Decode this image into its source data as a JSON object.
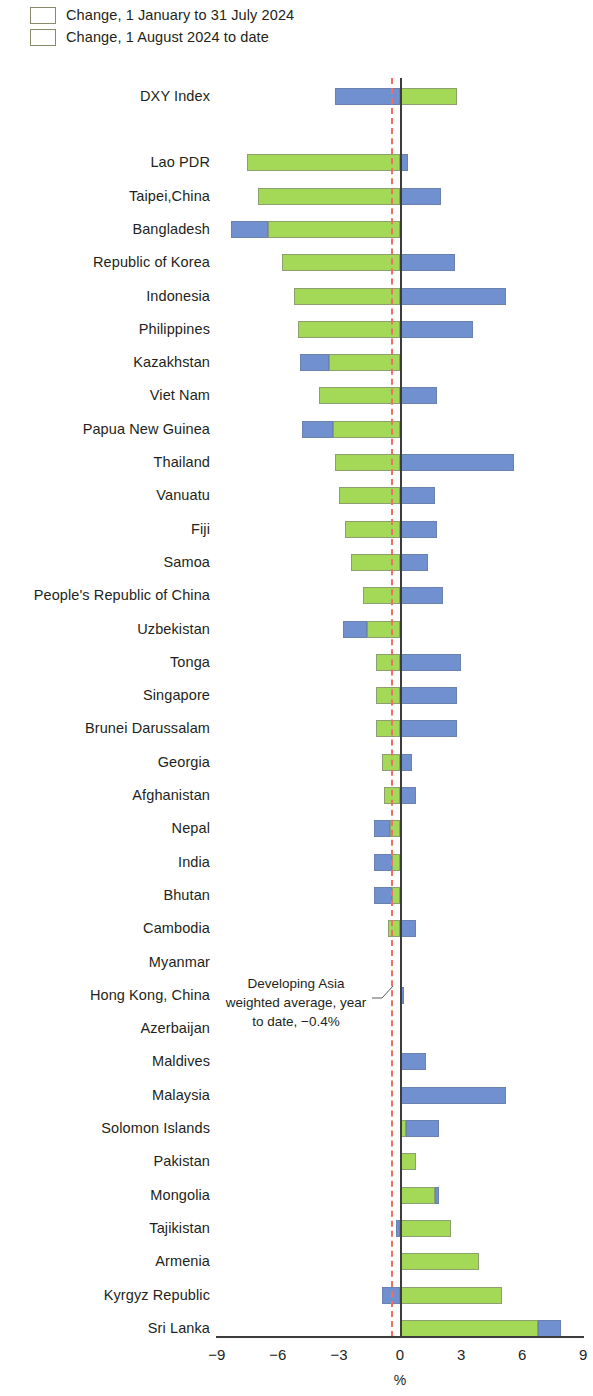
{
  "legend": {
    "items": [
      {
        "label": "Change, 1 January to 31 July 2024",
        "color": "#a3d957",
        "name": "series-jan-jul"
      },
      {
        "label": "Change, 1 August 2024 to date",
        "color": "#7190cf",
        "name": "series-aug-todate"
      }
    ]
  },
  "annotation": {
    "text": "Developing Asia weighted average, year to date, −0.4%",
    "value": -0.4,
    "color": "#ef6f62"
  },
  "axis": {
    "title": "%",
    "ticks": [
      "−9",
      "−6",
      "−3",
      "0",
      "3",
      "6",
      "9"
    ],
    "tick_values": [
      -9,
      -6,
      -3,
      0,
      3,
      6,
      9
    ]
  },
  "chart_data": {
    "type": "bar",
    "orientation": "horizontal",
    "stacked": true,
    "title": "",
    "xlabel": "%",
    "ylabel": "",
    "xlim": [
      -9,
      9
    ],
    "grid": false,
    "legend_position": "top-left",
    "annotations": [
      {
        "text": "Developing Asia weighted average, year to date, −0.4%",
        "value": -0.4,
        "type": "reference-line",
        "style": "dashed",
        "color": "#ef6f62"
      }
    ],
    "series": [
      {
        "name": "Change, 1 January to 31 July 2024",
        "color": "#a3d957"
      },
      {
        "name": "Change, 1 August 2024 to date",
        "color": "#7190cf"
      }
    ],
    "categories": [
      "DXY Index",
      "Lao PDR",
      "Taipei,China",
      "Bangladesh",
      "Republic of Korea",
      "Indonesia",
      "Philippines",
      "Kazakhstan",
      "Viet Nam",
      "Papua New Guinea",
      "Thailand",
      "Vanuatu",
      "Fiji",
      "Samoa",
      "People's Republic of China",
      "Uzbekistan",
      "Tonga",
      "Singapore",
      "Brunei Darussalam",
      "Georgia",
      "Afghanistan",
      "Nepal",
      "India",
      "Bhutan",
      "Cambodia",
      "Myanmar",
      "Hong Kong, China",
      "Azerbaijan",
      "Maldives",
      "Malaysia",
      "Solomon Islands",
      "Pakistan",
      "Mongolia",
      "Tajikistan",
      "Armenia",
      "Kyrgyz Republic",
      "Sri Lanka"
    ],
    "rows": [
      {
        "category": "DXY Index",
        "jan_jul": 2.8,
        "aug_todate": -3.2,
        "gap_after": true
      },
      {
        "category": "Lao PDR",
        "jan_jul": -7.5,
        "aug_todate": 0.4
      },
      {
        "category": "Taipei,China",
        "jan_jul": -7.0,
        "aug_todate": 2.0
      },
      {
        "category": "Bangladesh",
        "jan_jul": -6.5,
        "aug_todate": -1.8
      },
      {
        "category": "Republic of Korea",
        "jan_jul": -5.8,
        "aug_todate": 2.7
      },
      {
        "category": "Indonesia",
        "jan_jul": -5.2,
        "aug_todate": 5.2
      },
      {
        "category": "Philippines",
        "jan_jul": -5.0,
        "aug_todate": 3.6
      },
      {
        "category": "Kazakhstan",
        "jan_jul": -3.5,
        "aug_todate": -1.4
      },
      {
        "category": "Viet Nam",
        "jan_jul": -4.0,
        "aug_todate": 1.8
      },
      {
        "category": "Papua New Guinea",
        "jan_jul": -3.3,
        "aug_todate": -1.5
      },
      {
        "category": "Thailand",
        "jan_jul": -3.2,
        "aug_todate": 5.6
      },
      {
        "category": "Vanuatu",
        "jan_jul": -3.0,
        "aug_todate": 1.7
      },
      {
        "category": "Fiji",
        "jan_jul": -2.7,
        "aug_todate": 1.8
      },
      {
        "category": "Samoa",
        "jan_jul": -2.4,
        "aug_todate": 1.4
      },
      {
        "category": "People's Republic of China",
        "jan_jul": -1.8,
        "aug_todate": 2.1
      },
      {
        "category": "Uzbekistan",
        "jan_jul": -1.6,
        "aug_todate": -1.2
      },
      {
        "category": "Tonga",
        "jan_jul": -1.2,
        "aug_todate": 3.0
      },
      {
        "category": "Singapore",
        "jan_jul": -1.2,
        "aug_todate": 2.8
      },
      {
        "category": "Brunei Darussalam",
        "jan_jul": -1.2,
        "aug_todate": 2.8
      },
      {
        "category": "Georgia",
        "jan_jul": -0.9,
        "aug_todate": 0.6
      },
      {
        "category": "Afghanistan",
        "jan_jul": -0.8,
        "aug_todate": 0.8
      },
      {
        "category": "Nepal",
        "jan_jul": -0.5,
        "aug_todate": -0.8
      },
      {
        "category": "India",
        "jan_jul": -0.4,
        "aug_todate": -0.9
      },
      {
        "category": "Bhutan",
        "jan_jul": -0.4,
        "aug_todate": -0.9
      },
      {
        "category": "Cambodia",
        "jan_jul": -0.6,
        "aug_todate": 0.8
      },
      {
        "category": "Myanmar",
        "jan_jul": 0.0,
        "aug_todate": 0.0
      },
      {
        "category": "Hong Kong, China",
        "jan_jul": 0.0,
        "aug_todate": 0.2
      },
      {
        "category": "Azerbaijan",
        "jan_jul": 0.0,
        "aug_todate": 0.0
      },
      {
        "category": "Maldives",
        "jan_jul": 0.0,
        "aug_todate": 1.3
      },
      {
        "category": "Malaysia",
        "jan_jul": 0.0,
        "aug_todate": 5.2
      },
      {
        "category": "Solomon Islands",
        "jan_jul": 0.3,
        "aug_todate": 1.6
      },
      {
        "category": "Pakistan",
        "jan_jul": 0.8,
        "aug_todate": 0.0
      },
      {
        "category": "Mongolia",
        "jan_jul": 1.7,
        "aug_todate": 0.2
      },
      {
        "category": "Tajikistan",
        "jan_jul": 2.5,
        "aug_todate": -0.2
      },
      {
        "category": "Armenia",
        "jan_jul": 3.9,
        "aug_todate": 0.0
      },
      {
        "category": "Kyrgyz Republic",
        "jan_jul": 5.0,
        "aug_todate": -0.9
      },
      {
        "category": "Sri Lanka",
        "jan_jul": 6.8,
        "aug_todate": 1.1
      }
    ]
  }
}
